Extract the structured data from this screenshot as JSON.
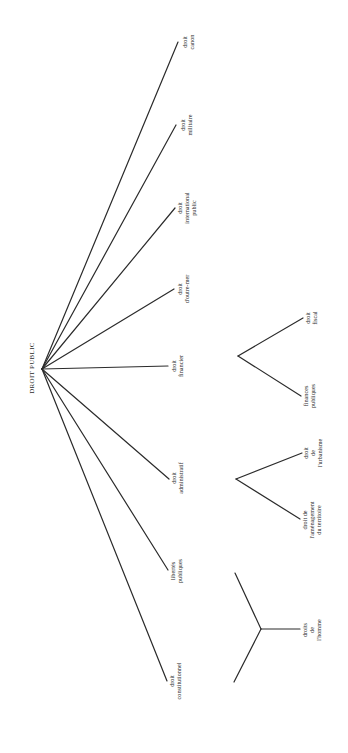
{
  "title": "DROIT PUBLIC",
  "root": {
    "label": "DROIT PUBLIC",
    "x": 42,
    "y": 369
  },
  "branches": [
    {
      "id": "canon",
      "lines": [
        "droit",
        "canon"
      ],
      "end": [
        178,
        42
      ]
    },
    {
      "id": "militaire",
      "lines": [
        "droit",
        "militaire"
      ],
      "end": [
        176,
        125
      ]
    },
    {
      "id": "international",
      "lines": [
        "droit",
        "international",
        "public"
      ],
      "end": [
        175,
        208
      ]
    },
    {
      "id": "outre-mer",
      "lines": [
        "droit",
        "d'outre-mer"
      ],
      "end": [
        174,
        289
      ]
    },
    {
      "id": "financier",
      "lines": [
        "droit",
        "financier"
      ],
      "end": [
        168,
        366
      ]
    },
    {
      "id": "administratif",
      "lines": [
        "droit",
        "administratif"
      ],
      "end": [
        169,
        479
      ]
    },
    {
      "id": "libertes",
      "lines": [
        "libertés",
        "publiques"
      ],
      "end": [
        168,
        570
      ]
    },
    {
      "id": "constitutionnel",
      "lines": [
        "droit",
        "constitutionnel"
      ],
      "end": [
        167,
        681
      ]
    }
  ],
  "subtrees": {
    "financier": {
      "node": [
        238,
        356
      ],
      "children": [
        {
          "id": "fiscal",
          "lines": [
            "droit",
            "fiscal"
          ],
          "end": [
            303,
            318
          ]
        },
        {
          "id": "finances-publiques",
          "lines": [
            "finances",
            "publiques"
          ],
          "end": [
            301,
            396
          ]
        }
      ]
    },
    "administratif": {
      "node": [
        236,
        479
      ],
      "children": [
        {
          "id": "urbanisme",
          "lines": [
            "droit",
            "de",
            "l'urbanisme"
          ],
          "end": [
            302,
            453
          ]
        },
        {
          "id": "amenagement",
          "lines": [
            "droit de",
            "l'aménagement",
            "du territoire"
          ],
          "end": [
            300,
            519
          ]
        }
      ]
    },
    "libertes": {
      "node": [
        261,
        629
      ],
      "children": [
        {
          "id": "upper-unlabeled",
          "lines": [],
          "end": [
            235,
            573
          ]
        },
        {
          "id": "lower-unlabeled",
          "lines": [],
          "end": [
            234,
            682
          ]
        },
        {
          "id": "droits-homme",
          "lines": [
            "droits",
            "de",
            "l'homme"
          ],
          "end": [
            300,
            629
          ]
        }
      ]
    }
  }
}
